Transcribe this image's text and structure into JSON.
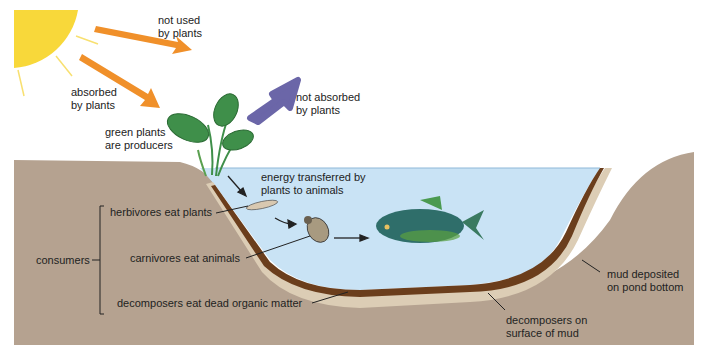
{
  "colors": {
    "sun": "#f8d83a",
    "orange_arrow": "#f0902a",
    "purple_arrow": "#6b66a8",
    "water": "#c9e3f5",
    "soil": "#b5a290",
    "sand_layer": "#dccdb5",
    "mud_layer": "#6b3e1c",
    "leaf": "#3f8f4a",
    "fish": "#2f6e6a"
  },
  "labels": {
    "not_used": [
      "not used",
      "by plants"
    ],
    "absorbed": [
      "absorbed",
      "by plants"
    ],
    "not_absorbed": [
      "not absorbed",
      "by plants"
    ],
    "producers": [
      "green plants",
      "are producers"
    ],
    "energy": [
      "energy transferred by",
      "plants to animals"
    ],
    "consumers": "consumers",
    "herbivores": "herbivores eat plants",
    "carnivores": "carnivores eat animals",
    "decomposers": "decomposers eat dead organic matter",
    "mud": [
      "mud deposited",
      "on pond bottom"
    ],
    "decomposers_mud": [
      "decomposers on",
      "surface of mud"
    ]
  }
}
